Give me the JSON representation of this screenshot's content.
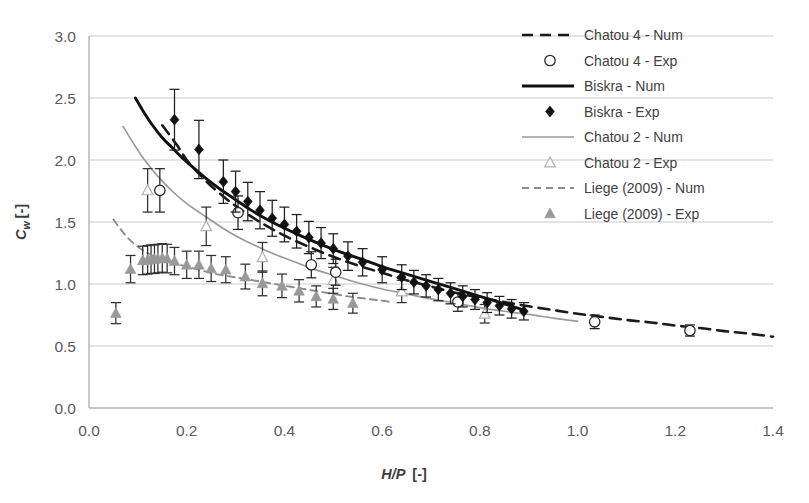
{
  "chart_data": {
    "type": "scatter",
    "title": "",
    "xlabel": "H/P [-]",
    "ylabel": "Cw [-]",
    "xlim": [
      0.0,
      1.4
    ],
    "ylim": [
      0.0,
      3.0
    ],
    "xticks": [
      "0.0",
      "0.2",
      "0.4",
      "0.6",
      "0.8",
      "1.0",
      "1.2",
      "1.4"
    ],
    "yticks": [
      "0.0",
      "0.5",
      "1.0",
      "1.5",
      "2.0",
      "2.5",
      "3.0"
    ],
    "xtick_values": [
      0.0,
      0.2,
      0.4,
      0.6,
      0.8,
      1.0,
      1.2,
      1.4
    ],
    "ytick_values": [
      0.0,
      0.5,
      1.0,
      1.5,
      2.0,
      2.5,
      3.0
    ],
    "grid": "horizontal",
    "legend_position": "top-right",
    "series": [
      {
        "name": "Chatou 4 - Num",
        "style": "dashed",
        "color": "#1a1a1a",
        "marker": "none",
        "points": [
          [
            0.15,
            2.28
          ],
          [
            0.18,
            2.12
          ],
          [
            0.2,
            2.0
          ],
          [
            0.22,
            1.91
          ],
          [
            0.25,
            1.79
          ],
          [
            0.28,
            1.69
          ],
          [
            0.3,
            1.63
          ],
          [
            0.35,
            1.5
          ],
          [
            0.4,
            1.39
          ],
          [
            0.45,
            1.3
          ],
          [
            0.5,
            1.22
          ],
          [
            0.55,
            1.15
          ],
          [
            0.6,
            1.09
          ],
          [
            0.65,
            1.03
          ],
          [
            0.7,
            0.98
          ],
          [
            0.75,
            0.93
          ],
          [
            0.8,
            0.89
          ],
          [
            0.85,
            0.855
          ],
          [
            0.9,
            0.82
          ],
          [
            0.95,
            0.79
          ],
          [
            1.0,
            0.76
          ],
          [
            1.05,
            0.735
          ],
          [
            1.1,
            0.71
          ],
          [
            1.15,
            0.69
          ],
          [
            1.2,
            0.665
          ],
          [
            1.25,
            0.645
          ],
          [
            1.3,
            0.62
          ],
          [
            1.35,
            0.6
          ],
          [
            1.4,
            0.575
          ]
        ]
      },
      {
        "name": "Chatou 4 - Exp",
        "style": "markers",
        "color": "#2b2b2b",
        "marker": "open-circle",
        "points": [
          [
            0.145,
            1.755,
            0.175
          ],
          [
            0.305,
            1.575,
            0.135
          ],
          [
            0.455,
            1.155,
            0.105
          ],
          [
            0.505,
            1.095,
            0.105
          ],
          [
            0.755,
            0.855,
            0.075
          ],
          [
            1.035,
            0.695,
            0.055
          ],
          [
            1.23,
            0.625,
            0.045
          ]
        ]
      },
      {
        "name": "Biskra - Num",
        "style": "solid",
        "color": "#111111",
        "marker": "none",
        "points": [
          [
            0.095,
            2.5
          ],
          [
            0.11,
            2.4
          ],
          [
            0.13,
            2.28
          ],
          [
            0.15,
            2.18
          ],
          [
            0.17,
            2.1
          ],
          [
            0.19,
            2.02
          ],
          [
            0.21,
            1.95
          ],
          [
            0.24,
            1.85
          ],
          [
            0.27,
            1.76
          ],
          [
            0.3,
            1.68
          ],
          [
            0.33,
            1.6
          ],
          [
            0.36,
            1.53
          ],
          [
            0.4,
            1.45
          ],
          [
            0.45,
            1.36
          ],
          [
            0.5,
            1.28
          ],
          [
            0.55,
            1.21
          ],
          [
            0.6,
            1.14
          ],
          [
            0.65,
            1.08
          ],
          [
            0.7,
            1.02
          ],
          [
            0.75,
            0.96
          ],
          [
            0.8,
            0.9
          ],
          [
            0.85,
            0.84
          ],
          [
            0.89,
            0.79
          ]
        ]
      },
      {
        "name": "Biskra - Exp",
        "style": "markers",
        "color": "#111111",
        "marker": "filled-diamond",
        "points": [
          [
            0.175,
            2.325,
            0.245
          ],
          [
            0.225,
            2.085,
            0.235
          ],
          [
            0.275,
            1.825,
            0.175
          ],
          [
            0.3,
            1.745,
            0.165
          ],
          [
            0.325,
            1.665,
            0.155
          ],
          [
            0.35,
            1.595,
            0.15
          ],
          [
            0.375,
            1.53,
            0.145
          ],
          [
            0.4,
            1.48,
            0.14
          ],
          [
            0.425,
            1.425,
            0.135
          ],
          [
            0.45,
            1.375,
            0.13
          ],
          [
            0.475,
            1.33,
            0.125
          ],
          [
            0.5,
            1.285,
            0.12
          ],
          [
            0.53,
            1.225,
            0.115
          ],
          [
            0.56,
            1.175,
            0.11
          ],
          [
            0.6,
            1.115,
            0.105
          ],
          [
            0.64,
            1.055,
            0.1
          ],
          [
            0.665,
            1.015,
            0.095
          ],
          [
            0.69,
            0.985,
            0.09
          ],
          [
            0.715,
            0.955,
            0.09
          ],
          [
            0.74,
            0.925,
            0.085
          ],
          [
            0.765,
            0.9,
            0.085
          ],
          [
            0.79,
            0.875,
            0.08
          ],
          [
            0.815,
            0.85,
            0.08
          ],
          [
            0.84,
            0.825,
            0.075
          ],
          [
            0.865,
            0.8,
            0.075
          ],
          [
            0.89,
            0.78,
            0.07
          ]
        ]
      },
      {
        "name": "Chatou 2 - Num",
        "style": "solid-grey",
        "color": "#9a9a9a",
        "marker": "none",
        "points": [
          [
            0.07,
            2.27
          ],
          [
            0.09,
            2.14
          ],
          [
            0.11,
            2.02
          ],
          [
            0.13,
            1.92
          ],
          [
            0.15,
            1.83
          ],
          [
            0.17,
            1.75
          ],
          [
            0.19,
            1.68
          ],
          [
            0.21,
            1.62
          ],
          [
            0.24,
            1.54
          ],
          [
            0.27,
            1.46
          ],
          [
            0.3,
            1.39
          ],
          [
            0.34,
            1.31
          ],
          [
            0.38,
            1.24
          ],
          [
            0.42,
            1.18
          ],
          [
            0.46,
            1.12
          ],
          [
            0.5,
            1.07
          ],
          [
            0.55,
            1.01
          ],
          [
            0.6,
            0.96
          ],
          [
            0.65,
            0.92
          ],
          [
            0.7,
            0.88
          ],
          [
            0.75,
            0.845
          ],
          [
            0.8,
            0.81
          ],
          [
            0.85,
            0.78
          ],
          [
            0.9,
            0.755
          ],
          [
            0.95,
            0.725
          ],
          [
            1.0,
            0.7
          ]
        ]
      },
      {
        "name": "Chatou 2 - Exp",
        "style": "markers",
        "color": "#b0b0b0",
        "marker": "open-triangle",
        "points": [
          [
            0.12,
            1.755,
            0.175
          ],
          [
            0.24,
            1.465,
            0.155
          ],
          [
            0.355,
            1.215,
            0.12
          ],
          [
            0.5,
            1.03,
            0.105
          ],
          [
            0.64,
            0.94,
            0.09
          ],
          [
            0.81,
            0.76,
            0.075
          ]
        ]
      },
      {
        "name": "Liege (2009) - Num",
        "style": "dashed-grey",
        "color": "#8c8c8c",
        "marker": "none",
        "points": [
          [
            0.05,
            1.52
          ],
          [
            0.065,
            1.44
          ],
          [
            0.08,
            1.37
          ],
          [
            0.1,
            1.3
          ],
          [
            0.12,
            1.25
          ],
          [
            0.14,
            1.21
          ],
          [
            0.16,
            1.18
          ],
          [
            0.18,
            1.16
          ],
          [
            0.2,
            1.14
          ],
          [
            0.23,
            1.11
          ],
          [
            0.26,
            1.08
          ],
          [
            0.29,
            1.06
          ],
          [
            0.32,
            1.04
          ],
          [
            0.35,
            1.02
          ],
          [
            0.38,
            1.0
          ],
          [
            0.41,
            0.98
          ],
          [
            0.44,
            0.96
          ],
          [
            0.47,
            0.94
          ],
          [
            0.5,
            0.92
          ],
          [
            0.53,
            0.9
          ],
          [
            0.56,
            0.885
          ],
          [
            0.59,
            0.87
          ],
          [
            0.62,
            0.855
          ]
        ]
      },
      {
        "name": "Liege (2009) - Exp",
        "style": "markers",
        "color": "#999999",
        "marker": "filled-triangle",
        "points": [
          [
            0.055,
            0.765,
            0.085
          ],
          [
            0.085,
            1.12,
            0.11
          ],
          [
            0.11,
            1.19,
            0.115
          ],
          [
            0.12,
            1.195,
            0.115
          ],
          [
            0.127,
            1.2,
            0.115
          ],
          [
            0.134,
            1.2,
            0.115
          ],
          [
            0.141,
            1.205,
            0.115
          ],
          [
            0.15,
            1.21,
            0.115
          ],
          [
            0.16,
            1.205,
            0.115
          ],
          [
            0.175,
            1.185,
            0.11
          ],
          [
            0.2,
            1.155,
            0.11
          ],
          [
            0.225,
            1.155,
            0.11
          ],
          [
            0.25,
            1.125,
            0.105
          ],
          [
            0.28,
            1.115,
            0.105
          ],
          [
            0.32,
            1.06,
            0.1
          ],
          [
            0.355,
            1.005,
            0.1
          ],
          [
            0.395,
            0.985,
            0.095
          ],
          [
            0.43,
            0.945,
            0.09
          ],
          [
            0.465,
            0.9,
            0.085
          ],
          [
            0.5,
            0.88,
            0.085
          ],
          [
            0.54,
            0.845,
            0.08
          ]
        ]
      }
    ]
  },
  "legend": {
    "items": [
      {
        "label": "Chatou 4 - Num",
        "kind": "line-dashed",
        "color": "#1a1a1a"
      },
      {
        "label": "Chatou 4 - Exp",
        "kind": "marker-open-circle",
        "color": "#2b2b2b"
      },
      {
        "label": "Biskra - Num",
        "kind": "line-solid",
        "color": "#111111"
      },
      {
        "label": "Biskra - Exp",
        "kind": "marker-filled-diamond",
        "color": "#111111"
      },
      {
        "label": "Chatou 2 - Num",
        "kind": "line-solid-grey",
        "color": "#9a9a9a"
      },
      {
        "label": "Chatou 2 - Exp",
        "kind": "marker-open-triangle",
        "color": "#b0b0b0"
      },
      {
        "label": "Liege (2009) - Num",
        "kind": "line-dashed-grey",
        "color": "#8c8c8c"
      },
      {
        "label": "Liege (2009) - Exp",
        "kind": "marker-filled-triangle",
        "color": "#999999"
      }
    ]
  },
  "axes": {
    "x_title_main": "H/P",
    "x_title_unit": "[-]",
    "y_title_main": "C",
    "y_title_sub": "w",
    "y_title_unit": "[-]"
  }
}
